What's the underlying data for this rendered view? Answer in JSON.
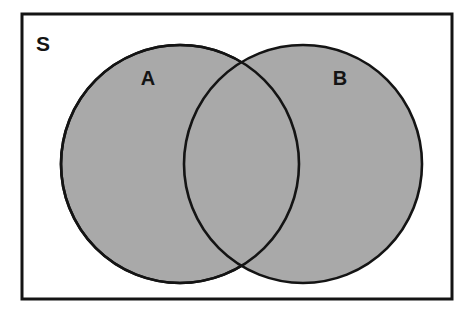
{
  "diagram": {
    "type": "venn-2-set",
    "canvas": {
      "width": 473,
      "height": 318,
      "background": "#ffffff"
    },
    "universe": {
      "label": "S",
      "name": "universal-set",
      "shape": "rectangle",
      "x": 22,
      "y": 14,
      "width": 430,
      "height": 285,
      "fill": "#ffffff",
      "stroke": "#141414",
      "stroke_width": 3,
      "label_x": 43,
      "label_y": 45
    },
    "sets": [
      {
        "label": "A",
        "name": "set-a",
        "shape": "circle",
        "cx": 180,
        "cy": 164,
        "r": 119,
        "fill": "#a9a9a9",
        "stroke": "#141414",
        "stroke_width": 2.6,
        "label_x": 148,
        "label_y": 80
      },
      {
        "label": "B",
        "name": "set-b",
        "shape": "circle",
        "cx": 303,
        "cy": 164,
        "r": 119,
        "fill": "#a9a9a9",
        "stroke": "#141414",
        "stroke_width": 2.6,
        "label_x": 340,
        "label_y": 80
      }
    ],
    "intersection": {
      "name": "intersection-a-b",
      "shaded": true,
      "fill": "#a9a9a9",
      "note": "A and B both shaded; overlap region same gray, no darker shading"
    },
    "colors": {
      "shade_gray": "#a9a9a9",
      "line_black": "#141414",
      "background_white": "#ffffff"
    }
  }
}
